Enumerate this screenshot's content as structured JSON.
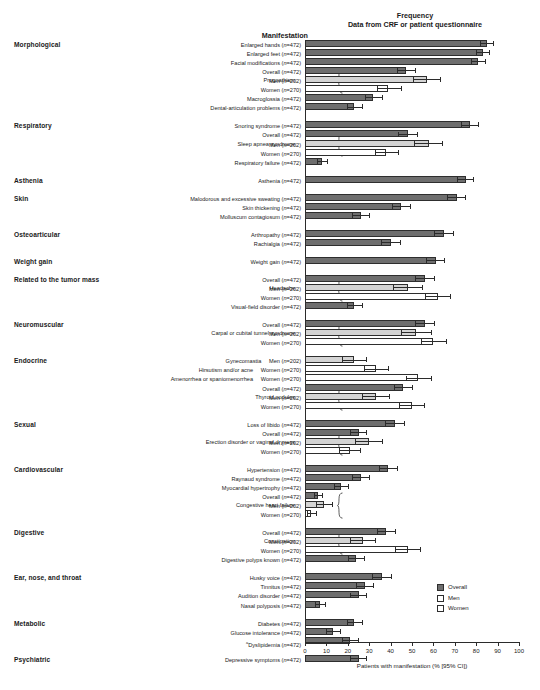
{
  "header": {
    "manifestation_title": "Manifestation",
    "frequency_title": "Frequency",
    "frequency_subtitle": "Data from CRF or patient questionnaire"
  },
  "legend": {
    "position": "bottom-right",
    "items": [
      {
        "label": "Overall",
        "color": "#6e6e6e"
      },
      {
        "label": "Men",
        "color": "#ffffff"
      },
      {
        "label": "Women",
        "color": "#ffffff"
      }
    ]
  },
  "axis": {
    "xlabel": "Patients with manifestation (% [95% CI])",
    "ticks": [
      "0",
      "10",
      "20",
      "30",
      "40",
      "50",
      "60",
      "70",
      "80",
      "90",
      "100"
    ],
    "xmin": 0,
    "xmax": 100
  },
  "footnote": "a",
  "chart_data": {
    "type": "bar",
    "orientation": "horizontal",
    "xlabel": "Patients with manifestation (% [95% CI])",
    "ylabel": "Manifestation",
    "xlim": [
      0,
      100
    ],
    "grid": false,
    "legend": [
      "Overall",
      "Men",
      "Women"
    ],
    "categories": [
      {
        "category": "Morphological",
        "rows": [
          {
            "label": "Enlarged hands",
            "n": "472",
            "series": "Overall",
            "value": 85.0,
            "ci_low": 82.0,
            "ci_high": 88.0
          },
          {
            "label": "Enlarged feet",
            "n": "472",
            "series": "Overall",
            "value": 83.0,
            "ci_low": 80.0,
            "ci_high": 86.5
          },
          {
            "label": "Facial modifications",
            "n": "472",
            "series": "Overall",
            "value": 81.0,
            "ci_low": 77.5,
            "ci_high": 84.5
          },
          {
            "label": "Prognathism",
            "n": "472",
            "series": "Overall",
            "value": 47.0,
            "ci_low": 43.0,
            "ci_high": 51.5
          },
          {
            "label": "Prognathism",
            "n": "202",
            "series": "Men",
            "value": 57.0,
            "ci_low": 50.5,
            "ci_high": 63.5
          },
          {
            "label": "Prognathism",
            "n": "270",
            "series": "Women",
            "value": 39.0,
            "ci_low": 33.5,
            "ci_high": 45.0
          },
          {
            "label": "Macroglossia",
            "n": "472",
            "series": "Overall",
            "value": 32.0,
            "ci_low": 28.0,
            "ci_high": 36.5
          },
          {
            "label": "Dental-articulation problems",
            "n": "472",
            "series": "Overall",
            "value": 23.0,
            "ci_low": 19.5,
            "ci_high": 27.0
          }
        ]
      },
      {
        "category": "Respiratory",
        "rows": [
          {
            "label": "Snoring syndrome",
            "n": "472",
            "series": "Overall",
            "value": 77.0,
            "ci_low": 73.0,
            "ci_high": 81.0
          },
          {
            "label": "Sleep apnea syndrome",
            "n": "472",
            "series": "Overall",
            "value": 48.0,
            "ci_low": 43.5,
            "ci_high": 52.5
          },
          {
            "label": "Sleep apnea syndrome",
            "n": "202",
            "series": "Men",
            "value": 58.0,
            "ci_low": 51.0,
            "ci_high": 64.5
          },
          {
            "label": "Sleep apnea syndrome",
            "n": "270",
            "series": "Women",
            "value": 38.0,
            "ci_low": 32.5,
            "ci_high": 44.0
          },
          {
            "label": "Respiratory failure",
            "n": "472",
            "series": "Overall",
            "value": 8.0,
            "ci_low": 5.5,
            "ci_high": 10.5
          }
        ]
      },
      {
        "category": "Asthenia",
        "rows": [
          {
            "label": "Asthenia",
            "n": "472",
            "series": "Overall",
            "value": 75.0,
            "ci_low": 71.0,
            "ci_high": 79.0
          }
        ]
      },
      {
        "category": "Skin",
        "rows": [
          {
            "label": "Malodorous and excessive sweating",
            "n": "472",
            "series": "Overall",
            "value": 71.0,
            "ci_low": 66.5,
            "ci_high": 75.0
          },
          {
            "label": "Skin thickening",
            "n": "472",
            "series": "Overall",
            "value": 45.0,
            "ci_low": 40.5,
            "ci_high": 49.5
          },
          {
            "label": "Molluscum contagiosum",
            "n": "472",
            "series": "Overall",
            "value": 26.0,
            "ci_low": 22.0,
            "ci_high": 30.0
          }
        ]
      },
      {
        "category": "Osteoarticular",
        "rows": [
          {
            "label": "Arthropathy",
            "n": "472",
            "series": "Overall",
            "value": 65.0,
            "ci_low": 60.5,
            "ci_high": 69.5
          },
          {
            "label": "Rachialgia",
            "n": "472",
            "series": "Overall",
            "value": 40.0,
            "ci_low": 35.5,
            "ci_high": 44.5
          }
        ]
      },
      {
        "category": "Weight gain",
        "rows": [
          {
            "label": "Weight gain",
            "n": "472",
            "series": "Overall",
            "value": 61.0,
            "ci_low": 56.5,
            "ci_high": 65.5
          }
        ]
      },
      {
        "category": "Related to the tumor mass",
        "rows": [
          {
            "label": "Headache",
            "n": "472",
            "series": "Overall",
            "value": 56.0,
            "ci_low": 51.5,
            "ci_high": 60.5
          },
          {
            "label": "Headache",
            "n": "202",
            "series": "Men",
            "value": 48.0,
            "ci_low": 41.0,
            "ci_high": 55.0
          },
          {
            "label": "Headache",
            "n": "270",
            "series": "Women",
            "value": 62.0,
            "ci_low": 56.0,
            "ci_high": 68.0
          },
          {
            "label": "Visual-field disorder",
            "n": "472",
            "series": "Overall",
            "value": 23.0,
            "ci_low": 19.5,
            "ci_high": 27.0
          }
        ]
      },
      {
        "category": "Neuromuscular",
        "rows": [
          {
            "label": "Carpal or cubital tunnel syndrome",
            "n": "472",
            "series": "Overall",
            "value": 56.0,
            "ci_low": 51.5,
            "ci_high": 60.5
          },
          {
            "label": "Carpal or cubital tunnel syndrome",
            "n": "202",
            "series": "Men",
            "value": 52.0,
            "ci_low": 45.0,
            "ci_high": 59.0
          },
          {
            "label": "Carpal or cubital tunnel syndrome",
            "n": "270",
            "series": "Women",
            "value": 60.0,
            "ci_low": 54.0,
            "ci_high": 66.0
          }
        ]
      },
      {
        "category": "Endocrine",
        "rows": [
          {
            "label": "Gynecomastia",
            "n": "202",
            "series": "Men",
            "value": 23.0,
            "ci_low": 17.5,
            "ci_high": 29.0
          },
          {
            "label": "Hirsutism and/or acne",
            "n": "270",
            "series": "Women",
            "value": 33.0,
            "ci_low": 27.5,
            "ci_high": 39.0
          },
          {
            "label": "Amenorrhea or spaniomenorrhea",
            "n": "270",
            "series": "Women",
            "value": 53.0,
            "ci_low": 47.0,
            "ci_high": 59.0
          },
          {
            "label": "Thyroid nodules",
            "n": "472",
            "series": "Overall",
            "value": 46.0,
            "ci_low": 41.5,
            "ci_high": 50.5
          },
          {
            "label": "Thyroid nodules",
            "n": "202",
            "series": "Men",
            "value": 33.0,
            "ci_low": 26.5,
            "ci_high": 39.5
          },
          {
            "label": "Thyroid nodules",
            "n": "270",
            "series": "Women",
            "value": 50.0,
            "ci_low": 44.0,
            "ci_high": 56.0
          }
        ]
      },
      {
        "category": "Sexual",
        "rows": [
          {
            "label": "Loss of libido",
            "n": "472",
            "series": "Overall",
            "value": 42.0,
            "ci_low": 37.5,
            "ci_high": 46.5
          },
          {
            "label": "Erection disorder or vaginal dryness",
            "n": "472",
            "series": "Overall",
            "value": 25.0,
            "ci_low": 21.0,
            "ci_high": 29.0
          },
          {
            "label": "Erection disorder or vaginal dryness",
            "n": "202",
            "series": "Men",
            "value": 30.0,
            "ci_low": 23.5,
            "ci_high": 36.5
          },
          {
            "label": "Erection disorder or vaginal dryness",
            "n": "270",
            "series": "Women",
            "value": 21.0,
            "ci_low": 16.0,
            "ci_high": 26.0
          }
        ]
      },
      {
        "category": "Cardiovascular",
        "rows": [
          {
            "label": "Hypertension",
            "n": "472",
            "series": "Overall",
            "value": 39.0,
            "ci_low": 34.5,
            "ci_high": 43.5
          },
          {
            "label": "Raynaud syndrome",
            "n": "472",
            "series": "Overall",
            "value": 26.0,
            "ci_low": 22.0,
            "ci_high": 30.0
          },
          {
            "label": "Myocardial hypertrophy",
            "n": "472",
            "series": "Overall",
            "value": 17.0,
            "ci_low": 13.5,
            "ci_high": 20.5
          },
          {
            "label": "Congestive heart failure",
            "n": "472",
            "series": "Overall",
            "value": 6.0,
            "ci_low": 4.0,
            "ci_high": 8.5
          },
          {
            "label": "Congestive heart failure",
            "n": "202",
            "series": "Men",
            "value": 9.0,
            "ci_low": 5.0,
            "ci_high": 13.0
          },
          {
            "label": "Congestive heart failure",
            "n": "270",
            "series": "Women",
            "value": 3.0,
            "ci_low": 1.0,
            "ci_high": 5.5
          }
        ]
      },
      {
        "category": "Digestive",
        "rows": [
          {
            "label": "Constipation",
            "n": "472",
            "series": "Overall",
            "value": 38.0,
            "ci_low": 33.5,
            "ci_high": 42.5
          },
          {
            "label": "Constipation",
            "n": "202",
            "series": "Men",
            "value": 27.0,
            "ci_low": 21.0,
            "ci_high": 33.0
          },
          {
            "label": "Constipation",
            "n": "270",
            "series": "Women",
            "value": 48.0,
            "ci_low": 42.0,
            "ci_high": 54.0
          },
          {
            "label": "Digestive polyps known",
            "n": "472",
            "series": "Overall",
            "value": 24.0,
            "ci_low": 20.0,
            "ci_high": 28.0
          }
        ]
      },
      {
        "category": "Ear, nose, and throat",
        "rows": [
          {
            "label": "Husky voice",
            "n": "472",
            "series": "Overall",
            "value": 36.0,
            "ci_low": 31.5,
            "ci_high": 40.5
          },
          {
            "label": "Tinnitus",
            "n": "472",
            "series": "Overall",
            "value": 28.0,
            "ci_low": 24.0,
            "ci_high": 32.0
          },
          {
            "label": "Audition disorder",
            "n": "472",
            "series": "Overall",
            "value": 25.0,
            "ci_low": 21.0,
            "ci_high": 29.0
          },
          {
            "label": "Nasal polyposis",
            "n": "472",
            "series": "Overall",
            "value": 7.0,
            "ci_low": 4.5,
            "ci_high": 9.5
          }
        ]
      },
      {
        "category": "Metabolic",
        "rows": [
          {
            "label": "Diabetes",
            "n": "472",
            "series": "Overall",
            "value": 23.0,
            "ci_low": 19.5,
            "ci_high": 27.0
          },
          {
            "label": "Glucose intolerance",
            "n": "472",
            "series": "Overall",
            "value": 13.0,
            "ci_low": 10.0,
            "ci_high": 16.5
          },
          {
            "label": "Dyslipidemia",
            "n": "472",
            "series": "Overall",
            "value": 21.0,
            "ci_low": 17.5,
            "ci_high": 25.0,
            "footnote": "a"
          }
        ]
      },
      {
        "category": "Psychiatric",
        "rows": [
          {
            "label": "Depressive symptoms",
            "n": "472",
            "series": "Overall",
            "value": 25.0,
            "ci_low": 21.0,
            "ci_high": 29.0
          }
        ]
      }
    ]
  }
}
